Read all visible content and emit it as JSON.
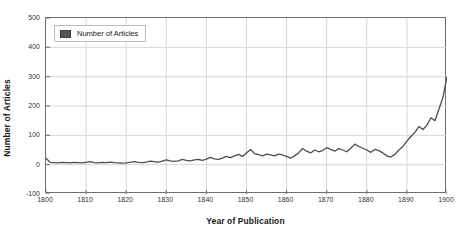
{
  "chart_data": {
    "type": "line",
    "title": "",
    "xlabel": "Year of Publication",
    "ylabel": "Number of Articles",
    "xlim": [
      1800,
      1900
    ],
    "ylim": [
      -100,
      500
    ],
    "grid": true,
    "legend_position": "upper-left-inside",
    "xticks": [
      "1800",
      "1810",
      "1820",
      "1830",
      "1840",
      "1850",
      "1860",
      "1870",
      "1880",
      "1890",
      "1900"
    ],
    "xtick_values": [
      1800,
      1810,
      1820,
      1830,
      1840,
      1850,
      1860,
      1870,
      1880,
      1890,
      1900
    ],
    "yticks": [
      "500",
      "400",
      "300",
      "200",
      "100",
      "0",
      "-100"
    ],
    "ytick_values": [
      500,
      400,
      300,
      200,
      100,
      0,
      -100
    ],
    "line_color": "#4d4d4d",
    "series": [
      {
        "name": "Number of Articles",
        "x": [
          1800,
          1801,
          1802,
          1803,
          1804,
          1805,
          1806,
          1807,
          1808,
          1809,
          1810,
          1811,
          1812,
          1813,
          1814,
          1815,
          1816,
          1817,
          1818,
          1819,
          1820,
          1821,
          1822,
          1823,
          1824,
          1825,
          1826,
          1827,
          1828,
          1829,
          1830,
          1831,
          1832,
          1833,
          1834,
          1835,
          1836,
          1837,
          1838,
          1839,
          1840,
          1841,
          1842,
          1843,
          1844,
          1845,
          1846,
          1847,
          1848,
          1849,
          1850,
          1851,
          1852,
          1853,
          1854,
          1855,
          1856,
          1857,
          1858,
          1859,
          1860,
          1861,
          1862,
          1863,
          1864,
          1865,
          1866,
          1867,
          1868,
          1869,
          1870,
          1871,
          1872,
          1873,
          1874,
          1875,
          1876,
          1877,
          1878,
          1879,
          1880,
          1881,
          1882,
          1883,
          1884,
          1885,
          1886,
          1887,
          1888,
          1889,
          1890,
          1891,
          1892,
          1893,
          1894,
          1895,
          1896,
          1897,
          1898,
          1899,
          1900
        ],
        "values": [
          22,
          8,
          7,
          6,
          8,
          7,
          6,
          8,
          7,
          6,
          8,
          10,
          7,
          6,
          8,
          7,
          9,
          7,
          6,
          5,
          6,
          8,
          10,
          8,
          7,
          9,
          12,
          10,
          9,
          12,
          16,
          13,
          11,
          13,
          18,
          15,
          13,
          16,
          18,
          15,
          19,
          25,
          20,
          18,
          22,
          28,
          24,
          30,
          35,
          28,
          40,
          52,
          38,
          34,
          30,
          36,
          33,
          30,
          36,
          33,
          28,
          22,
          30,
          40,
          55,
          46,
          40,
          50,
          44,
          48,
          58,
          52,
          46,
          55,
          50,
          44,
          56,
          70,
          62,
          56,
          50,
          42,
          52,
          48,
          40,
          30,
          26,
          35,
          50,
          62,
          80,
          96,
          110,
          130,
          120,
          135,
          160,
          150,
          190,
          230,
          300
        ]
      }
    ],
    "series_display": {
      "comment": "dense yearly series rendered as polyline"
    }
  },
  "legend": {
    "label": "Number of Articles"
  }
}
